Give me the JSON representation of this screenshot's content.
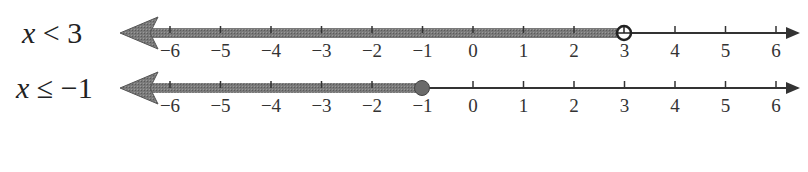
{
  "number_lines": [
    {
      "label_var": "x",
      "label_rest": " < 3",
      "inequality": "x < 3",
      "endpoint": 3,
      "endpoint_type": "open",
      "direction": "left",
      "ticks": [
        "−6",
        "−5",
        "−4",
        "−3",
        "−2",
        "−1",
        "0",
        "1",
        "2",
        "3",
        "4",
        "5",
        "6"
      ]
    },
    {
      "label_var": "x",
      "label_rest": " ≤ −1",
      "inequality": "x ≤ −1",
      "endpoint": -1,
      "endpoint_type": "closed",
      "direction": "left",
      "ticks": [
        "−6",
        "−5",
        "−4",
        "−3",
        "−2",
        "−1",
        "0",
        "1",
        "2",
        "3",
        "4",
        "5",
        "6"
      ]
    }
  ],
  "colors": {
    "shade": "#6e6e6e",
    "line": "#333333",
    "text": "#222222"
  }
}
